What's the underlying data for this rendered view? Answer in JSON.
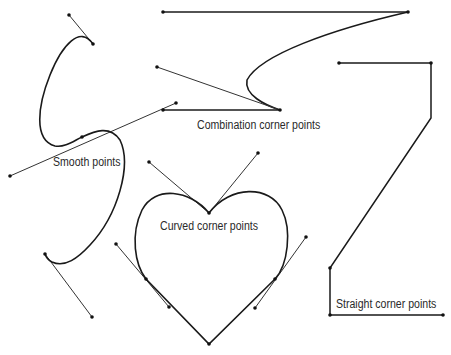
{
  "diagram": {
    "labels": {
      "smooth": "Smooth points",
      "combination": "Combination corner points",
      "curved": "Curved corner points",
      "straight": "Straight corner points"
    },
    "colors": {
      "background": "#ffffff",
      "path": "#1a1a1a",
      "handle": "#333333",
      "text": "#2a2a2a"
    },
    "groups": [
      {
        "name": "smooth-points",
        "anchors": [
          [
            93,
            44
          ],
          [
            82,
            137
          ],
          [
            45,
            254
          ]
        ],
        "handles": [
          [
            [
              93,
              44
            ],
            [
              69,
              15
            ]
          ],
          [
            [
              10,
              176
            ],
            [
              176,
              103
            ]
          ],
          [
            [
              45,
              254
            ],
            [
              92,
              317
            ]
          ]
        ]
      },
      {
        "name": "combination-corner-points",
        "anchors": [
          [
            163,
            12
          ],
          [
            408,
            12
          ],
          [
            280,
            110
          ],
          [
            163,
            110
          ]
        ],
        "handles": [
          [
            [
              157,
              67
            ],
            [
              280,
              110
            ]
          ]
        ]
      },
      {
        "name": "curved-corner-points",
        "anchors": [
          [
            209,
            213
          ],
          [
            146,
            279
          ],
          [
            275,
            279
          ],
          [
            209,
            344
          ]
        ],
        "handles": [
          [
            [
              149,
              162
            ],
            [
              209,
              213
            ]
          ],
          [
            [
              258,
              153
            ],
            [
              209,
              213
            ]
          ],
          [
            [
              116,
              244
            ],
            [
              169,
              307
            ]
          ],
          [
            [
              306,
              237
            ],
            [
              255,
              308
            ]
          ]
        ]
      },
      {
        "name": "straight-corner-points",
        "anchors": [
          [
            339,
            63
          ],
          [
            431,
            63
          ],
          [
            431,
            118
          ],
          [
            330,
            268
          ],
          [
            330,
            315
          ],
          [
            443,
            315
          ]
        ],
        "handles": []
      }
    ]
  }
}
